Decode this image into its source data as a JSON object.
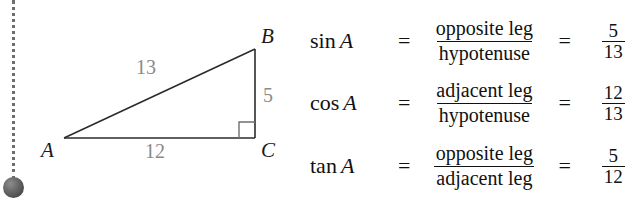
{
  "figure": {
    "triangle": {
      "vertices": [
        {
          "name": "A",
          "label": "A",
          "x": 64,
          "y": 138
        },
        {
          "name": "B",
          "label": "B",
          "x": 255,
          "y": 49
        },
        {
          "name": "C",
          "label": "C",
          "x": 255,
          "y": 138
        }
      ],
      "sides": [
        {
          "name": "hypotenuse",
          "label": "13",
          "from": "A",
          "to": "B"
        },
        {
          "name": "opposite-leg",
          "label": "5",
          "from": "B",
          "to": "C"
        },
        {
          "name": "adjacent-leg",
          "label": "12",
          "from": "A",
          "to": "C"
        }
      ],
      "right_angle_at": "C",
      "stroke_color": "#2b2b2b",
      "side_label_color": "#8a8a8a",
      "vertex_label_color": "#1a1a1a"
    },
    "pin": {
      "line_style": "dotted",
      "line_color": "#6e6e6e",
      "ball_color": "#5a5a5a"
    }
  },
  "formulas": {
    "equals": "=",
    "rows": [
      {
        "function": "sin",
        "variable": "A",
        "numerator": "opposite leg",
        "denominator": "hypotenuse",
        "value_numerator": "5",
        "value_denominator": "13"
      },
      {
        "function": "cos",
        "variable": "A",
        "numerator": "adjacent leg",
        "denominator": "hypotenuse",
        "value_numerator": "12",
        "value_denominator": "13"
      },
      {
        "function": "tan",
        "variable": "A",
        "numerator": "opposite leg",
        "denominator": "adjacent leg",
        "value_numerator": "5",
        "value_denominator": "12"
      }
    ]
  }
}
